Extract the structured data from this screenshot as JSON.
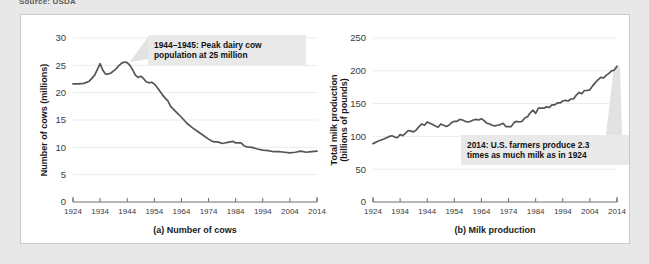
{
  "source_note": "Source: USDA",
  "figure": {
    "background": "#ffffff",
    "border_color": "#c9c9c9"
  },
  "colors": {
    "line": "#555555",
    "grid": "#ebebeb",
    "axis": "#6e6e6e",
    "callout_bg": "#e9e9e9",
    "leader": "#e2e2e2",
    "page_bg": "#e8e8e8"
  },
  "chart_data": [
    {
      "type": "line",
      "id": "number-of-cows",
      "title": "",
      "caption": "(a) Number of cows",
      "xlabel": "",
      "ylabel": "Number of cows (millions)",
      "ylabel_lines": [
        "Number of cows (millions)"
      ],
      "xlim": [
        1924,
        2014
      ],
      "ylim": [
        0,
        30
      ],
      "yticks": [
        0,
        5,
        10,
        15,
        20,
        25,
        30
      ],
      "ytick_labels": [
        "0",
        "5",
        "10",
        "15",
        "20",
        "25",
        "30"
      ],
      "xticks": [
        1924,
        1934,
        1944,
        1954,
        1964,
        1974,
        1984,
        1994,
        2004,
        2014
      ],
      "xtick_labels": [
        "1924",
        "1934",
        "1944",
        "1954",
        "1964",
        "1974",
        "1984",
        "1994",
        "2004",
        "2014"
      ],
      "grid": true,
      "legend": "none",
      "annotation": {
        "lines": [
          "1944–1945: Peak dairy cow",
          "population at 25 million"
        ],
        "target_x": 1945,
        "target_y": 25.6
      },
      "x": [
        1924,
        1926,
        1928,
        1930,
        1932,
        1934,
        1935,
        1936,
        1937,
        1938,
        1939,
        1940,
        1941,
        1942,
        1943,
        1944,
        1945,
        1946,
        1947,
        1948,
        1949,
        1950,
        1951,
        1952,
        1953,
        1954,
        1955,
        1956,
        1957,
        1958,
        1959,
        1960,
        1962,
        1964,
        1966,
        1968,
        1970,
        1972,
        1974,
        1975,
        1976,
        1977,
        1978,
        1979,
        1980,
        1981,
        1982,
        1983,
        1984,
        1985,
        1986,
        1987,
        1988,
        1990,
        1992,
        1994,
        1996,
        1998,
        2000,
        2002,
        2004,
        2006,
        2008,
        2010,
        2012,
        2014
      ],
      "y": [
        21.6,
        21.6,
        21.7,
        22.1,
        23.2,
        25.3,
        24.1,
        23.4,
        23.4,
        23.6,
        24.0,
        24.4,
        25.0,
        25.4,
        25.6,
        25.5,
        25.0,
        24.2,
        23.2,
        22.8,
        23.0,
        22.6,
        22.0,
        21.8,
        21.9,
        21.6,
        21.0,
        20.3,
        19.6,
        19.0,
        18.5,
        17.5,
        16.5,
        15.5,
        14.4,
        13.6,
        12.9,
        12.2,
        11.5,
        11.2,
        11.0,
        11.0,
        10.9,
        10.7,
        10.8,
        10.9,
        11.0,
        11.1,
        10.8,
        10.8,
        10.8,
        10.3,
        10.1,
        10.0,
        9.7,
        9.5,
        9.4,
        9.2,
        9.2,
        9.1,
        9.0,
        9.1,
        9.3,
        9.1,
        9.2,
        9.3
      ]
    },
    {
      "type": "line",
      "id": "milk-production",
      "title": "",
      "caption": "(b) Milk production",
      "xlabel": "",
      "ylabel": "Total milk production (billions of pounds)",
      "ylabel_lines": [
        "Total milk production",
        "(billions of pounds)"
      ],
      "xlim": [
        1924,
        2014
      ],
      "ylim": [
        0,
        250
      ],
      "yticks": [
        0,
        50,
        100,
        150,
        200,
        250
      ],
      "ytick_labels": [
        "0",
        "50",
        "100",
        "150",
        "200",
        "250"
      ],
      "xticks": [
        1924,
        1934,
        1944,
        1954,
        1964,
        1974,
        1984,
        1994,
        2004,
        2014
      ],
      "xtick_labels": [
        "1924",
        "1934",
        "1944",
        "1954",
        "1964",
        "1974",
        "1984",
        "1994",
        "2004",
        "2014"
      ],
      "grid": true,
      "legend": "none",
      "annotation": {
        "lines": [
          "2014: U.S. farmers produce 2.3",
          "times as much milk as in 1924"
        ],
        "target_x": 2014,
        "target_y": 207
      },
      "x": [
        1924,
        1926,
        1928,
        1930,
        1931,
        1932,
        1933,
        1934,
        1935,
        1936,
        1937,
        1938,
        1939,
        1940,
        1941,
        1942,
        1943,
        1944,
        1945,
        1946,
        1947,
        1948,
        1949,
        1950,
        1951,
        1952,
        1953,
        1954,
        1955,
        1956,
        1957,
        1958,
        1959,
        1960,
        1961,
        1962,
        1963,
        1964,
        1965,
        1966,
        1967,
        1968,
        1969,
        1970,
        1971,
        1972,
        1973,
        1974,
        1975,
        1976,
        1977,
        1978,
        1979,
        1980,
        1981,
        1982,
        1983,
        1984,
        1985,
        1986,
        1987,
        1988,
        1989,
        1990,
        1991,
        1992,
        1993,
        1994,
        1995,
        1996,
        1997,
        1998,
        1999,
        2000,
        2001,
        2002,
        2003,
        2004,
        2005,
        2006,
        2007,
        2008,
        2009,
        2010,
        2011,
        2012,
        2013,
        2014
      ],
      "y": [
        89,
        93,
        96,
        100,
        101,
        99,
        98,
        103,
        101,
        105,
        109,
        108,
        107,
        110,
        115,
        119,
        117,
        122,
        120,
        118,
        116,
        114,
        119,
        117,
        115,
        117,
        121,
        123,
        123,
        126,
        125,
        123,
        122,
        123,
        125,
        126,
        125,
        127,
        124,
        120,
        119,
        117,
        116,
        117,
        118,
        120,
        115,
        115,
        115,
        121,
        123,
        122,
        123,
        128,
        130,
        136,
        140,
        135,
        143,
        143,
        143,
        145,
        144,
        148,
        148,
        151,
        151,
        154,
        155,
        154,
        157,
        157,
        163,
        167,
        165,
        170,
        170,
        171,
        177,
        182,
        186,
        190,
        189,
        193,
        196,
        200,
        201,
        207
      ]
    }
  ]
}
